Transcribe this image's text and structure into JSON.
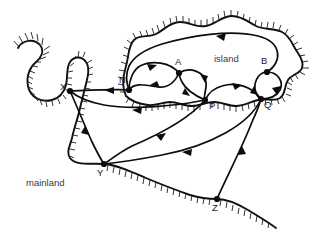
{
  "figure": {
    "width": 323,
    "height": 231,
    "background_color": "#ffffff",
    "ink_color": "#0c0c0c",
    "label_color": "#3a3a3a"
  },
  "regions": [
    {
      "id": "island",
      "label": "island",
      "label_x": 214,
      "label_y": 62,
      "description": "landmass at upper right enclosed by hatched coastline"
    },
    {
      "id": "mainland",
      "label": "mainland",
      "label_x": 26,
      "label_y": 186,
      "description": "landmass at left and lower left enclosed by hatched coastline"
    }
  ],
  "nodes": [
    {
      "id": "X",
      "label": "X",
      "x": 70,
      "y": 91,
      "label_x": 60,
      "label_y": 90,
      "region": "mainland"
    },
    {
      "id": "N",
      "label": "N",
      "x": 129,
      "y": 90,
      "label_x": 119,
      "label_y": 83,
      "region": "island"
    },
    {
      "id": "A",
      "label": "A",
      "x": 179,
      "y": 73,
      "label_x": 175,
      "label_y": 65,
      "region": "island"
    },
    {
      "id": "B",
      "label": "B",
      "x": 267,
      "y": 72,
      "label_x": 261,
      "label_y": 64,
      "region": "island"
    },
    {
      "id": "P",
      "label": "P",
      "x": 205,
      "y": 100,
      "label_x": 209,
      "label_y": 109,
      "region": "island"
    },
    {
      "id": "Q",
      "label": "Q",
      "x": 261,
      "y": 99,
      "label_x": 264,
      "label_y": 108,
      "region": "island"
    },
    {
      "id": "Y",
      "label": "Y",
      "x": 104,
      "y": 164,
      "label_x": 97,
      "label_y": 176,
      "region": "mainland"
    },
    {
      "id": "Z",
      "label": "Z",
      "x": 217,
      "y": 199,
      "label_x": 212,
      "label_y": 211,
      "region": "mainland"
    }
  ],
  "edges": [
    {
      "id": "edge-N-X",
      "from": "N",
      "to": "X",
      "direction": "N to X",
      "arrow": "leftward"
    },
    {
      "id": "edge-N-A",
      "from": "N",
      "to": "A",
      "direction": "N to A",
      "arrow": "rightward-upper"
    },
    {
      "id": "edge-A-N",
      "from": "A",
      "to": "N",
      "direction": "A to N",
      "arrow": "leftward-lower"
    },
    {
      "id": "edge-A-P",
      "from": "A",
      "to": "P",
      "direction": "A to P",
      "arrow": "downward"
    },
    {
      "id": "edge-P-A",
      "from": "P",
      "to": "A",
      "direction": "P to A",
      "arrow": "upward"
    },
    {
      "id": "edge-B-N",
      "from": "B",
      "to": "N",
      "direction": "B to N along north coast",
      "arrow": "leftward"
    },
    {
      "id": "edge-B-Q",
      "from": "B",
      "to": "Q",
      "direction": "B to Q loop",
      "arrow": "downward"
    },
    {
      "id": "edge-Q-B",
      "from": "Q",
      "to": "B",
      "direction": "Q to B loop",
      "arrow": "upward"
    },
    {
      "id": "edge-Q-P",
      "from": "Q",
      "to": "P",
      "direction": "Q to P",
      "arrow": "leftward"
    },
    {
      "id": "edge-P-X",
      "from": "P",
      "to": "X",
      "direction": "P to X",
      "arrow": "leftward"
    },
    {
      "id": "edge-P-Y",
      "from": "P",
      "to": "Y",
      "direction": "P to Y",
      "arrow": "leftward-down"
    },
    {
      "id": "edge-Q-Y",
      "from": "Q",
      "to": "Y",
      "direction": "Q to Y",
      "arrow": "leftward"
    },
    {
      "id": "edge-X-Y",
      "from": "X",
      "to": "Y",
      "direction": "X to Y along coast",
      "arrow": "downward"
    },
    {
      "id": "edge-Z-Q",
      "from": "Z",
      "to": "Q",
      "direction": "Z to Q",
      "arrow": "upward"
    }
  ]
}
